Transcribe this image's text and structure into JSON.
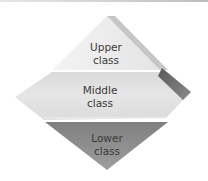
{
  "diagram": {
    "type": "class-structure-diamond",
    "layers": [
      {
        "id": "upper",
        "line1": "Upper",
        "line2": "class",
        "color": "#ececec"
      },
      {
        "id": "middle",
        "line1": "Middle",
        "line2": "class",
        "color": "#dedede"
      },
      {
        "id": "lower",
        "line1": "Lower",
        "line2": "class",
        "color": "#8f8f8f"
      }
    ],
    "accent_colors": {
      "upper_edge": "#c4c4c4",
      "middle_bevel": "#6e6e6e"
    }
  }
}
